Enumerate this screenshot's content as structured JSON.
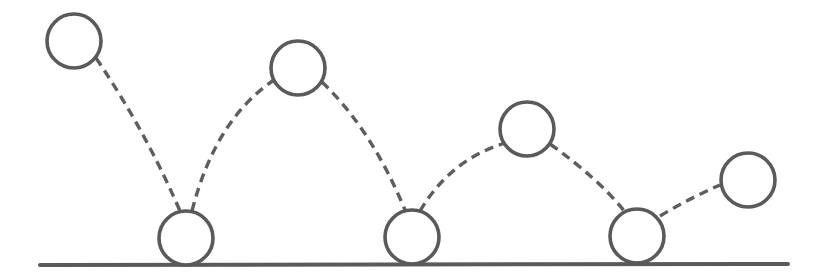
{
  "diagram": {
    "title": "",
    "colors": {
      "stroke": "#5a5a5a",
      "background": "#ffffff"
    },
    "ground": {
      "x1": 40,
      "y1": 265,
      "x2": 788,
      "y2": 264
    },
    "ball_radius": 27,
    "balls": [
      {
        "id": "ball-1",
        "cx": 74,
        "cy": 41,
        "state": "start-high"
      },
      {
        "id": "ball-2",
        "cx": 186,
        "cy": 238,
        "state": "bounce"
      },
      {
        "id": "ball-3",
        "cx": 298,
        "cy": 68,
        "state": "apex"
      },
      {
        "id": "ball-4",
        "cx": 412,
        "cy": 237,
        "state": "bounce"
      },
      {
        "id": "ball-5",
        "cx": 527,
        "cy": 129,
        "state": "apex"
      },
      {
        "id": "ball-6",
        "cx": 637,
        "cy": 236,
        "state": "bounce"
      },
      {
        "id": "ball-7",
        "cx": 748,
        "cy": 180,
        "state": "rising"
      }
    ],
    "trajectory_segments": [
      {
        "id": "seg-1",
        "d": "M 96 58 Q 145 130 180 211"
      },
      {
        "id": "seg-2",
        "d": "M 192 211 Q 215 120 274 80"
      },
      {
        "id": "seg-3",
        "d": "M 322 82 Q 372 130 405 210"
      },
      {
        "id": "seg-4",
        "d": "M 420 211 Q 450 160 505 143"
      },
      {
        "id": "seg-5",
        "d": "M 550 144 Q 600 180 625 212"
      },
      {
        "id": "seg-6",
        "d": "M 660 216 Q 690 198 720 185"
      }
    ]
  }
}
